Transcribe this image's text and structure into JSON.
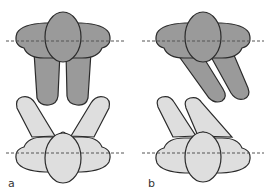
{
  "figure": {
    "panels": [
      {
        "id": "a",
        "label": "a",
        "description": "Two persons facing each other, top person legs straight down, bottom person legs spread in a V"
      },
      {
        "id": "b",
        "label": "b",
        "description": "Two persons facing each other with legs angled diagonally to the same side"
      }
    ]
  },
  "colors": {
    "top_figure_fill": "#9a9a9a",
    "bottom_figure_fill": "#dedede",
    "outline": "#2b2b2b",
    "reference_line": "#555555",
    "background": "#ffffff"
  }
}
